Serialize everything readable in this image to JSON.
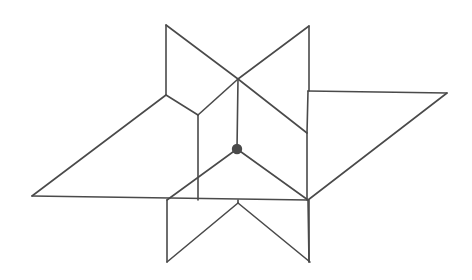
{
  "figure": {
    "type": "line-drawing",
    "canvas": {
      "width": 472,
      "height": 280,
      "background": "#ffffff"
    },
    "style": {
      "stroke_color": "#4a4a4a",
      "stroke_width": 1.6,
      "vertex_color": "#4a4a4a",
      "vertex_radius": 5.2
    },
    "points": {
      "top_left_apex": [
        166,
        25
      ],
      "top_right_apex": [
        309,
        26
      ],
      "left_apex": [
        32,
        196
      ],
      "right_apex": [
        447,
        93
      ],
      "bottom_left_apex": [
        167,
        262
      ],
      "bottom_right_apex": [
        310,
        262
      ],
      "cross_top": [
        238,
        79
      ],
      "center_dot": [
        237,
        149
      ],
      "left_notch": [
        166,
        95
      ],
      "right_notch": [
        308,
        91
      ],
      "inner_left": [
        198,
        115
      ],
      "inner_right": [
        307,
        133
      ],
      "base_left": [
        167,
        200
      ],
      "base_right": [
        308,
        200
      ]
    },
    "paths": [
      {
        "name": "upper-left-blade-vertical",
        "d": "M 166 25 L 166 95"
      },
      {
        "name": "upper-left-blade-diagonal",
        "d": "M 166 25 L 238 79"
      },
      {
        "name": "upper-right-blade-vertical",
        "d": "M 309 26 L 309 91"
      },
      {
        "name": "upper-right-blade-diagonal",
        "d": "M 309 26 L 238 79"
      },
      {
        "name": "cross-to-inner-left",
        "d": "M 238 79 L 198 115"
      },
      {
        "name": "cross-to-inner-right",
        "d": "M 238 79 L 307 133"
      },
      {
        "name": "center-vertical-spoke",
        "d": "M 238 79 L 237 149"
      },
      {
        "name": "center-spoke-lower-left",
        "d": "M 237 149 L 167 200"
      },
      {
        "name": "center-spoke-lower-right",
        "d": "M 237 149 L 308 200"
      },
      {
        "name": "inner-left-vertical",
        "d": "M 198 115 L 198 200"
      },
      {
        "name": "inner-right-vertical",
        "d": "M 307 133 L 307 200"
      },
      {
        "name": "left-notch-to-left-apex",
        "d": "M 166 95 L 32 196"
      },
      {
        "name": "baseline-horizontal",
        "d": "M 32 196 L 308 200"
      },
      {
        "name": "right-notch-to-right-apex",
        "d": "M 308 91 L 447 93"
      },
      {
        "name": "right-apex-to-base-right",
        "d": "M 447 93 L 308 200"
      },
      {
        "name": "left-notch-to-inner-left",
        "d": "M 166 95 L 198 115"
      },
      {
        "name": "right-notch-to-inner-right",
        "d": "M 308 91 L 307 133"
      },
      {
        "name": "lower-left-blade-vertical",
        "d": "M 167 200 L 167 262"
      },
      {
        "name": "lower-left-blade-diagonal",
        "d": "M 167 262 L 238 203"
      },
      {
        "name": "lower-right-blade-vertical",
        "d": "M 309 200 L 309 262"
      },
      {
        "name": "lower-right-blade-diagonal",
        "d": "M 310 262 L 238 203"
      },
      {
        "name": "bottom-center-stem",
        "d": "M 238 200 L 238 203"
      },
      {
        "name": "base-right-vertical-extension",
        "d": "M 308 200 L 309 262"
      }
    ]
  }
}
